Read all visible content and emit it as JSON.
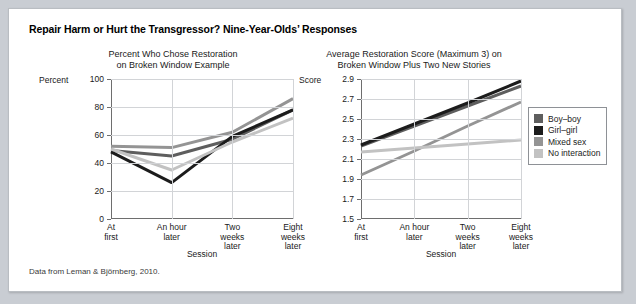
{
  "figure": {
    "title": "Repair Harm or Hurt the Transgressor? Nine-Year-Olds’ Responses",
    "source_note": "Data from Leman & Björnberg, 2010."
  },
  "legend": {
    "position": "right",
    "items": [
      {
        "label": "Boy–boy",
        "color": "#5e5e5e"
      },
      {
        "label": "Girl–girl",
        "color": "#1c1c1c"
      },
      {
        "label": "Mixed sex",
        "color": "#949494"
      },
      {
        "label": "No interaction",
        "color": "#c2c2c2"
      }
    ]
  },
  "chart_data": [
    {
      "type": "line",
      "title": "Percent Who Chose Restoration on Broken Window Example",
      "title_line1": "Percent Who Chose Restoration",
      "title_line2": "on Broken Window Example",
      "xlabel": "Session",
      "ylabel": "Percent",
      "ylim": [
        0,
        100
      ],
      "yticks": [
        0,
        20,
        40,
        60,
        80,
        100
      ],
      "ytick_labels": [
        "0",
        "20",
        "40",
        "60",
        "80",
        "100"
      ],
      "grid": true,
      "categories": [
        "At first",
        "An hour later",
        "Two weeks later",
        "Eight weeks later"
      ],
      "category_lines": [
        [
          "At",
          "first"
        ],
        [
          "An hour",
          "later"
        ],
        [
          "Two",
          "weeks",
          "later"
        ],
        [
          "Eight",
          "weeks",
          "later"
        ]
      ],
      "series": [
        {
          "name": "Boy–boy",
          "color": "#5e5e5e",
          "values": [
            49,
            45,
            57,
            78
          ]
        },
        {
          "name": "Girl–girl",
          "color": "#1c1c1c",
          "values": [
            48,
            26,
            59,
            78
          ]
        },
        {
          "name": "Mixed sex",
          "color": "#949494",
          "values": [
            52,
            51,
            62,
            86
          ]
        },
        {
          "name": "No interaction",
          "color": "#c2c2c2",
          "values": [
            50,
            35,
            55,
            72
          ]
        }
      ]
    },
    {
      "type": "line",
      "title": "Average Restoration Score (Maximum 3) on Broken Window Plus Two New Stories",
      "title_line1": "Average Restoration Score (Maximum 3) on",
      "title_line2": "Broken Window Plus Two New Stories",
      "xlabel": "Session",
      "ylabel": "Score",
      "ylim": [
        1.5,
        2.9
      ],
      "yticks": [
        1.5,
        1.7,
        1.9,
        2.1,
        2.3,
        2.5,
        2.7,
        2.9
      ],
      "ytick_labels": [
        "1.5",
        "1.7",
        "1.9",
        "2.1",
        "2.3",
        "2.5",
        "2.7",
        "2.9"
      ],
      "grid": true,
      "categories": [
        "At first",
        "An hour later",
        "Two weeks later",
        "Eight weeks later"
      ],
      "category_lines": [
        [
          "At",
          "first"
        ],
        [
          "An hour",
          "later"
        ],
        [
          "Two",
          "weeks",
          "later"
        ],
        [
          "Eight",
          "weeks",
          "later"
        ]
      ],
      "series": [
        {
          "name": "Boy–boy",
          "color": "#5e5e5e",
          "values": [
            2.23,
            2.43,
            2.63,
            2.83
          ]
        },
        {
          "name": "Girl–girl",
          "color": "#1c1c1c",
          "values": [
            2.24,
            2.45,
            2.66,
            2.88
          ]
        },
        {
          "name": "Mixed sex",
          "color": "#949494",
          "values": [
            1.94,
            2.18,
            2.43,
            2.67
          ]
        },
        {
          "name": "No interaction",
          "color": "#c2c2c2",
          "values": [
            2.17,
            2.21,
            2.25,
            2.29
          ]
        }
      ]
    }
  ]
}
